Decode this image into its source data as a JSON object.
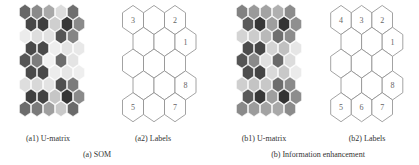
{
  "figure": {
    "panels": [
      {
        "id": "a1",
        "caption": "(a1) U-matrix",
        "type": "umatrix",
        "origin": [
          25,
          12
        ],
        "hex_w": 12,
        "row_h": 12.1,
        "rows": [
          [
            "#676767",
            "#8a8a8a",
            "#a9a9a9",
            "#dcdcdc",
            "#6f6f6f"
          ],
          [
            "#474747",
            "#404040",
            "#cfcfcf",
            "#383838",
            "#8a8a8a"
          ],
          [
            "#ececec",
            "#dedede",
            "#e2e2e2",
            "#555555",
            "#858585"
          ],
          [
            "#4a4a4a",
            "#4a4a4a",
            "#eeeeee",
            "#e4e4e4",
            "#e8e8e8"
          ],
          [
            "#565656",
            "#7d7d7d",
            "#f2f2f2",
            "#6c6c6c",
            "#e4e4e4"
          ],
          [
            "#4b4b4b",
            "#494949",
            "#ececec",
            "#e6e6e6",
            "#eeeeee"
          ],
          [
            "#dedede",
            "#d8d8d8",
            "#e3e3e3",
            "#4f4f4f",
            "#7b7b7b"
          ],
          [
            "#3f3f3f",
            "#434343",
            "#c6c6c6",
            "#353535",
            "#8a8a8a"
          ],
          [
            "#6c6c6c",
            "#7a7a7a",
            "#9f9f9f",
            "#c9c9c9",
            "#6a6a6a"
          ]
        ]
      },
      {
        "id": "a2",
        "caption": "(a2) Labels",
        "type": "labels",
        "origin": [
          133,
          20
        ],
        "hex_w": 21,
        "row_h": 21.8,
        "rows": [
          [
            "3",
            "",
            "2"
          ],
          [
            "",
            "",
            "1"
          ],
          [
            "",
            "",
            ""
          ],
          [
            "",
            "",
            "8"
          ],
          [
            "5",
            "",
            "7"
          ]
        ]
      },
      {
        "id": "b1",
        "caption": "(b1) U-matrix",
        "type": "umatrix",
        "origin": [
          242,
          12
        ],
        "hex_w": 12,
        "row_h": 12.1,
        "rows": [
          [
            "#828282",
            "#9a9a9a",
            "#a3a3a3",
            "#b0b0b0",
            "#8c8c8c"
          ],
          [
            "#5a5a5a",
            "#363636",
            "#9e9e9e",
            "#333333",
            "#8f8f8f"
          ],
          [
            "#d4d4d4",
            "#cccccc",
            "#b9b9b9",
            "#6e6e6e",
            "#8c8c8c"
          ],
          [
            "#4c4c4c",
            "#474747",
            "#d4d4d4",
            "#c0c0c0",
            "#e6e6e6"
          ],
          [
            "#555555",
            "#8a8a8a",
            "#e0e0e0",
            "#6a6a6a",
            "#dcdcdc"
          ],
          [
            "#4e4e4e",
            "#444444",
            "#dadada",
            "#c8c8c8",
            "#ebebeb"
          ],
          [
            "#cfcfcf",
            "#c4c4c4",
            "#c8c8c8",
            "#6d6d6d",
            "#8a8a8a"
          ],
          [
            "#5a5a5a",
            "#383838",
            "#9f9f9f",
            "#333333",
            "#8d8d8d"
          ],
          [
            "#8a8a8a",
            "#9c9c9c",
            "#a3a3a3",
            "#a9a9a9",
            "#8b8b8b"
          ]
        ]
      },
      {
        "id": "b2",
        "caption": "(b2) Labels",
        "type": "labels",
        "origin": [
          341,
          20
        ],
        "hex_w": 20.6,
        "row_h": 21.8,
        "rows": [
          [
            "4",
            "3",
            "2"
          ],
          [
            "",
            "",
            "1"
          ],
          [
            "",
            "",
            ""
          ],
          [
            "",
            "",
            "8"
          ],
          [
            "5",
            "6",
            "7"
          ]
        ]
      }
    ],
    "captions": {
      "a1": {
        "text": "(a1) U-matrix",
        "x": 48,
        "y": 134
      },
      "a2": {
        "text": "(a2) Labels",
        "x": 153,
        "y": 134
      },
      "b1": {
        "text": "(b1) U-matrix",
        "x": 264,
        "y": 134
      },
      "b2": {
        "text": "(b2) Labels",
        "x": 367,
        "y": 134
      },
      "a": {
        "text": "(a) SOM",
        "x": 97,
        "y": 150
      },
      "b": {
        "text": "(b) Information enhancement",
        "x": 318,
        "y": 150
      }
    },
    "stroke_color": "#8c8c8c"
  }
}
